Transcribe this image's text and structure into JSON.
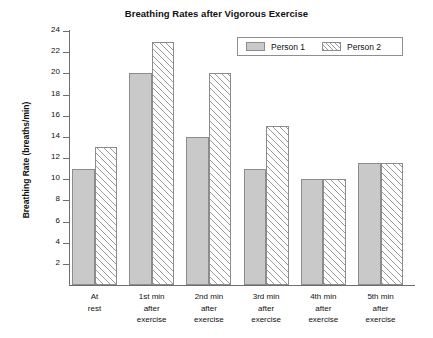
{
  "chart_data": {
    "type": "bar",
    "title": "Breathing Rates after Vigorous Exercise",
    "xlabel": "",
    "ylabel": "Breathing Rate (breaths/min)",
    "ylim": [
      0,
      24
    ],
    "yticks": [
      24,
      22,
      20,
      18,
      16,
      14,
      12,
      10,
      8,
      6,
      4,
      2
    ],
    "ytick_labels": [
      "24",
      "22",
      "20",
      "18",
      "16",
      "14",
      "12",
      "10",
      "8",
      "6",
      "4",
      "2"
    ],
    "grid": false,
    "legend_position": "top-right",
    "categories": [
      "At rest",
      "1st min after exercise",
      "2nd min after exercise",
      "3rd min after exercise",
      "4th min after exercise",
      "5th min after exercise"
    ],
    "category_label_lines": [
      [
        "At",
        "rest"
      ],
      [
        "1st min",
        "after",
        "exercise"
      ],
      [
        "2nd min",
        "after",
        "exercise"
      ],
      [
        "3rd min",
        "after",
        "exercise"
      ],
      [
        "4th min",
        "after",
        "exercise"
      ],
      [
        "5th min",
        "after",
        "exercise"
      ]
    ],
    "series": [
      {
        "name": "Person 1",
        "fill": "solid",
        "color": "#c9c9c9",
        "values": [
          11,
          20,
          14,
          11,
          10,
          11.5
        ]
      },
      {
        "name": "Person 2",
        "fill": "hatched",
        "color": "#ffffff",
        "values": [
          13,
          23,
          20,
          15,
          10,
          11.5
        ]
      }
    ]
  },
  "colors": {
    "series_1_fill": "#c9c9c9",
    "series_2_fill": "#ffffff",
    "hatch": "#9a9a9a",
    "bar_border": "#8c8c8c",
    "axis": "#6e6e6e",
    "text": "#111111",
    "background": "#ffffff"
  }
}
